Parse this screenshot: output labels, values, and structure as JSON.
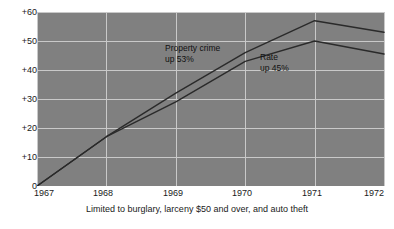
{
  "chart_data": {
    "type": "line",
    "title": "",
    "subtitle": "",
    "xlabel": "",
    "ylabel": "",
    "x": [
      1967,
      1968,
      1969,
      1970,
      1971,
      1972
    ],
    "xlim": [
      1967,
      1972
    ],
    "ylim": [
      0,
      60
    ],
    "xticklabels": [
      "1967",
      "1968",
      "1969",
      "1970",
      "1971",
      "1972"
    ],
    "yticklabels": [
      "0",
      "+10",
      "+20",
      "+30",
      "+40",
      "+50",
      "+60"
    ],
    "ytickvalues": [
      0,
      10,
      20,
      30,
      40,
      50,
      60
    ],
    "grid": true,
    "legend": "none",
    "series": [
      {
        "name": "Property crime",
        "values": [
          0,
          17,
          32,
          46,
          57,
          53
        ]
      },
      {
        "name": "Rate",
        "values": [
          0,
          17,
          29,
          43,
          50,
          45.5
        ]
      }
    ],
    "annotations": [
      {
        "id": "property-crime",
        "line1": "Property crime",
        "line2": "up 53%"
      },
      {
        "id": "rate",
        "line1": "Rate",
        "line2": "up 45%"
      }
    ],
    "caption": "Limited to burglary, larceny $50 and over, and auto theft",
    "caption_cut_off": "",
    "colors": {
      "plot_background": "#808080",
      "gridline": "#c9c9c9",
      "series_line": "#2a2a2a",
      "text": "#1a1a1a",
      "page_background": "#ffffff"
    }
  }
}
